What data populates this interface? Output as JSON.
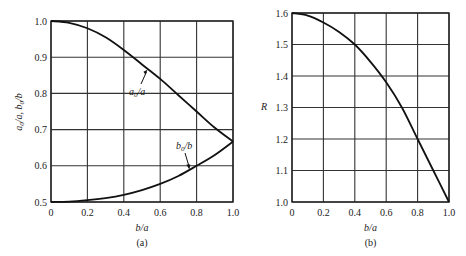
{
  "chart_data": [
    {
      "type": "line",
      "panel": "(a)",
      "title": "",
      "xlabel": "b/a",
      "ylabel": "a0/a, b0/b",
      "xlim": [
        0,
        1.0
      ],
      "ylim": [
        0.5,
        1.0
      ],
      "xticks": [
        "0",
        "0.2",
        "0.4",
        "0.6",
        "0.8",
        "1.0"
      ],
      "yticks": [
        "0.5",
        "0.6",
        "0.7",
        "0.8",
        "0.9",
        "1.0"
      ],
      "grid": true,
      "legend": "none",
      "x": [
        0,
        0.1,
        0.2,
        0.3,
        0.4,
        0.5,
        0.6,
        0.7,
        0.8,
        0.9,
        1.0
      ],
      "series": [
        {
          "name": "a0/a",
          "values": [
            1.0,
            0.995,
            0.98,
            0.955,
            0.92,
            0.88,
            0.84,
            0.795,
            0.75,
            0.705,
            0.667
          ]
        },
        {
          "name": "b0/b",
          "values": [
            0.5,
            0.501,
            0.505,
            0.511,
            0.52,
            0.533,
            0.55,
            0.572,
            0.6,
            0.63,
            0.667
          ]
        }
      ],
      "annotations": [
        {
          "text": "a0/a",
          "arrow_to": [
            0.53,
            0.865
          ]
        },
        {
          "text": "b0/b",
          "arrow_to": [
            0.76,
            0.59
          ]
        }
      ]
    },
    {
      "type": "line",
      "panel": "(b)",
      "title": "",
      "xlabel": "b/a",
      "ylabel": "R",
      "xlim": [
        0,
        1.0
      ],
      "ylim": [
        1.0,
        1.6
      ],
      "xticks": [
        "0",
        "0.2",
        "0.4",
        "0.6",
        "0.8",
        "1.0"
      ],
      "yticks": [
        "1.0",
        "1.1",
        "1.2",
        "1.3",
        "1.4",
        "1.5",
        "1.6"
      ],
      "grid": true,
      "legend": "none",
      "x": [
        0,
        0.1,
        0.2,
        0.3,
        0.4,
        0.5,
        0.6,
        0.7,
        0.8,
        0.9,
        1.0
      ],
      "series": [
        {
          "name": "R",
          "values": [
            1.6,
            1.592,
            1.57,
            1.54,
            1.5,
            1.445,
            1.38,
            1.3,
            1.2,
            1.1,
            1.0
          ]
        }
      ]
    }
  ],
  "panels": {
    "a": {
      "caption": "(a)",
      "xlabel": "b/a",
      "ylabel": "a₀/a, b₀/b",
      "label_a": "a",
      "label_a_sub": "0",
      "label_a_rest": "/a",
      "label_b": "b",
      "label_b_sub": "0",
      "label_b_rest": "/b"
    },
    "b": {
      "caption": "(b)",
      "xlabel": "b/a",
      "ylabel": "R"
    }
  }
}
